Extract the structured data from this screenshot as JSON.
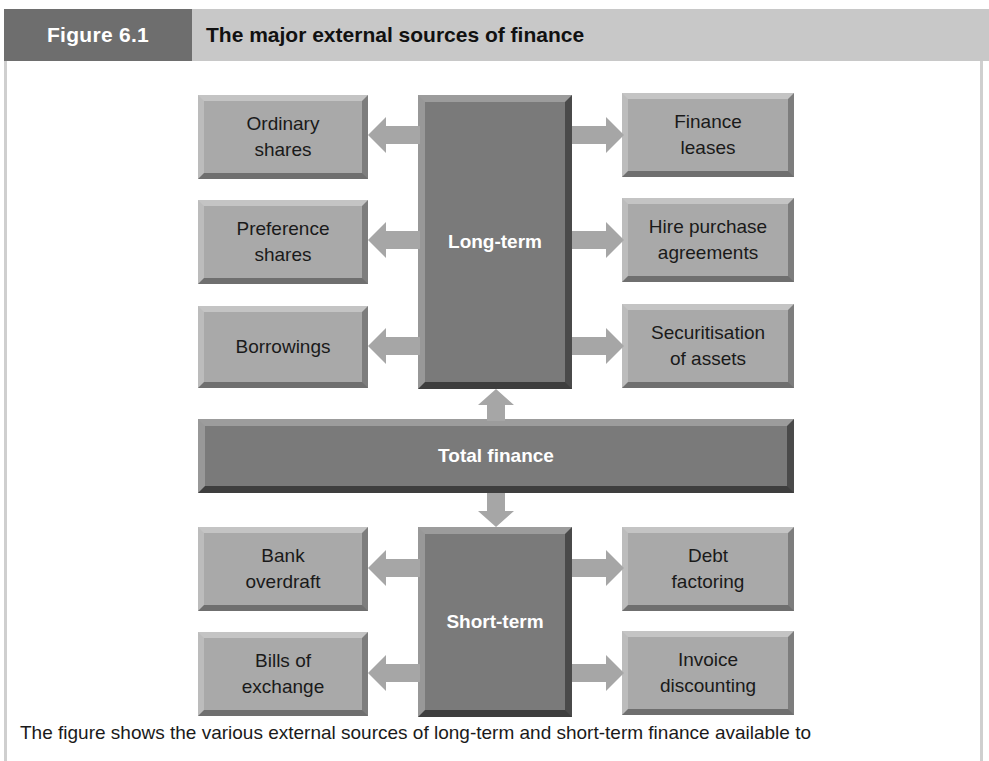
{
  "header": {
    "figure_label": "Figure 6.1",
    "title": "The major external sources of finance"
  },
  "diagram": {
    "center": {
      "label": "Total finance"
    },
    "long_term": {
      "label": "Long-term",
      "left": [
        {
          "label": "Ordinary\nshares"
        },
        {
          "label": "Preference\nshares"
        },
        {
          "label": "Borrowings"
        }
      ],
      "right": [
        {
          "label": "Finance\nleases"
        },
        {
          "label": "Hire purchase\nagreements"
        },
        {
          "label": "Securitisation\nof assets"
        }
      ]
    },
    "short_term": {
      "label": "Short-term",
      "left": [
        {
          "label": "Bank\noverdraft"
        },
        {
          "label": "Bills of\nexchange"
        }
      ],
      "right": [
        {
          "label": "Debt\nfactoring"
        },
        {
          "label": "Invoice\ndiscounting"
        }
      ]
    },
    "colors": {
      "header_dark": "#6e6e6e",
      "header_light": "#c8c8c8",
      "box_light": "#a9a9a9",
      "box_dark": "#7a7a7a",
      "arrow": "#a6a6a6"
    }
  },
  "caption": "The figure shows the various external sources of long-term and short-term finance available to"
}
